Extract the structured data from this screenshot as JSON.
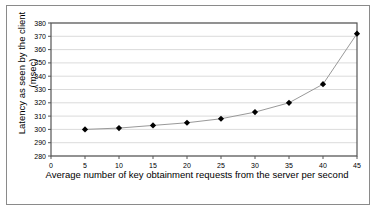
{
  "chart_data": {
    "type": "line",
    "title": "",
    "xlabel": "Average number of key obtainment requests from the server per second",
    "ylabel": "Latency as seen by the client (msec)",
    "ylabel_line1": "Latency as seen by the client",
    "ylabel_line2": "(msec)",
    "x": [
      5,
      10,
      15,
      20,
      25,
      30,
      35,
      40,
      45
    ],
    "values": [
      300,
      301,
      303,
      305,
      308,
      313,
      320,
      334,
      372
    ],
    "xticks": [
      0,
      5,
      10,
      15,
      20,
      25,
      30,
      35,
      40,
      45
    ],
    "yticks": [
      280,
      290,
      300,
      310,
      320,
      330,
      340,
      350,
      360,
      370,
      380
    ],
    "xlim": [
      0,
      45
    ],
    "ylim": [
      280,
      380
    ],
    "grid": true,
    "grid_axis": "y",
    "legend": false,
    "marker": "diamond",
    "marker_color": "#000000",
    "line_color": "#999999",
    "grid_color": "#cccccc",
    "axis_color": "#555555",
    "background": "#ffffff"
  }
}
